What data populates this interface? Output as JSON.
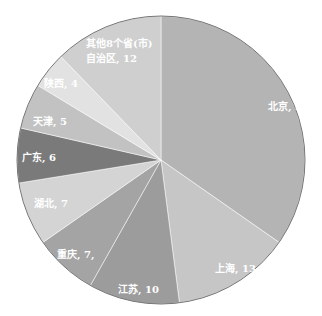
{
  "chart_data": {
    "type": "pie",
    "title": "",
    "categories": [
      "北京",
      "上海",
      "江苏",
      "重庆",
      "湖北",
      "广东",
      "天津",
      "陕西",
      "其他8个省(市)自治区"
    ],
    "values": [
      34,
      13,
      10,
      7,
      7,
      6,
      5,
      4,
      12
    ],
    "labels": [
      "北京, 34",
      "上海, 13",
      "江苏, 10",
      "重庆, 7,",
      "湖北, 7",
      "广东, 6",
      "天津, 5",
      "陕西, 4",
      "其他8个省(市)自治区, 12"
    ],
    "colors": [
      "#b4b4b4",
      "#c6c6c6",
      "#9c9c9c",
      "#a4a4a4",
      "#d4d4d4",
      "#7a7a7a",
      "#c2c2c2",
      "#e2e2e2",
      "#cfcfcf"
    ],
    "start_angle_deg": 0,
    "direction": "clockwise",
    "legend": "none"
  },
  "labels": {
    "beijing": "北京, 34",
    "shanghai": "上海, 13",
    "jiangsu": "江苏, 10",
    "chongqing": "重庆, 7,",
    "hubei": "湖北, 7",
    "guangdong": "广东, 6",
    "tianjin": "天津, 5",
    "shaanxi": "陕西, 4",
    "other_line1": "其他8个省(市)",
    "other_line2": "自治区, 12"
  }
}
